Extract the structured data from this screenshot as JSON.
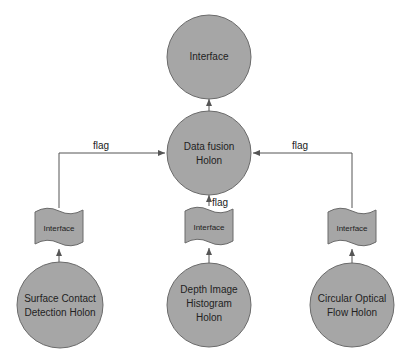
{
  "colors": {
    "node_fill": "#a6a6a6",
    "node_stroke": "#6a6a6a",
    "edge": "#555555",
    "background": "#ffffff"
  },
  "nodes": {
    "top_interface": {
      "label": "Interface"
    },
    "fusion": {
      "line1": "Data fusion",
      "line2": "Holon"
    },
    "interface_left": {
      "label": "Interface"
    },
    "interface_center": {
      "label": "Interface"
    },
    "interface_right": {
      "label": "Interface"
    },
    "surface": {
      "line1": "Surface Contact",
      "line2": "Detection Holon"
    },
    "depth": {
      "line1": "Depth Image",
      "line2": "Histogram",
      "line3": "Holon"
    },
    "optical": {
      "line1": "Circular Optical",
      "line2": "Flow Holon"
    }
  },
  "edges": {
    "left_label": "flag",
    "center_label": "flag",
    "right_label": "flag"
  }
}
